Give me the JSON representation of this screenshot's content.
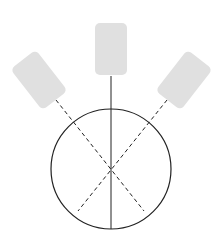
{
  "diagram": {
    "colors": {
      "background": "#ffffff",
      "pad_fill": "#e0e0e0",
      "line": "#222222"
    },
    "circle": {
      "cx": 111,
      "cy": 169,
      "r": 60
    },
    "pads": [
      {
        "name": "left-pad",
        "cx": 39,
        "cy": 80,
        "w": 32,
        "h": 52,
        "rotate": -38
      },
      {
        "name": "center-pad",
        "cx": 111,
        "cy": 49,
        "w": 32,
        "h": 52,
        "rotate": 0
      },
      {
        "name": "right-pad",
        "cx": 184,
        "cy": 80,
        "w": 32,
        "h": 52,
        "rotate": 38
      }
    ]
  }
}
